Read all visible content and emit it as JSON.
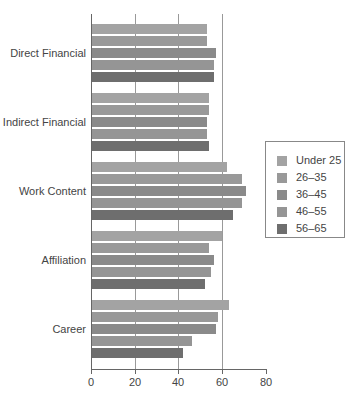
{
  "chart_data": {
    "type": "bar",
    "orientation": "horizontal",
    "title": "",
    "xlabel": "",
    "ylabel": "",
    "xlim": [
      0,
      80
    ],
    "x_ticks": [
      0,
      20,
      40,
      60,
      80
    ],
    "grid": true,
    "legend_position": "right",
    "categories": [
      "Direct Financial",
      "Indirect Financial",
      "Work Content",
      "Affiliation",
      "Career"
    ],
    "series": [
      {
        "name": "Under 25",
        "color": "#a3a3a3",
        "values": [
          53,
          54,
          62,
          60,
          63
        ]
      },
      {
        "name": "26–35",
        "color": "#999999",
        "values": [
          53,
          54,
          69,
          54,
          58
        ]
      },
      {
        "name": "36–45",
        "color": "#8a8a8a",
        "values": [
          57,
          53,
          71,
          56,
          57
        ]
      },
      {
        "name": "46–55",
        "color": "#959595",
        "values": [
          56,
          53,
          69,
          55,
          46
        ]
      },
      {
        "name": "56–65",
        "color": "#6e6e6e",
        "values": [
          56,
          54,
          65,
          52,
          42
        ]
      }
    ]
  },
  "labels": {
    "categories": [
      "Direct Financial",
      "Indirect Financial",
      "Work Content",
      "Affiliation",
      "Career"
    ],
    "ticks": [
      "0",
      "20",
      "40",
      "60",
      "80"
    ],
    "legend": [
      "Under 25",
      "26–35",
      "36–45",
      "46–55",
      "56–65"
    ]
  }
}
